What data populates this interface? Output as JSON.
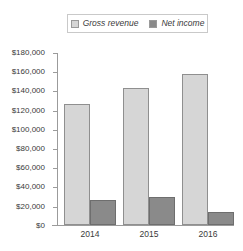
{
  "legend": {
    "position": "top-center",
    "entries": [
      {
        "label": "Gross revenue",
        "color": "#d6d6d6",
        "icon": "legend-swatch-icon"
      },
      {
        "label": "Net income",
        "color": "#8a8a8a",
        "icon": "legend-swatch-icon"
      }
    ]
  },
  "chart_data": {
    "type": "bar",
    "title": "",
    "xlabel": "",
    "ylabel": "",
    "categories": [
      "2014",
      "2015",
      "2016"
    ],
    "series": [
      {
        "name": "Gross revenue",
        "color": "#d6d6d6",
        "values": [
          127000,
          143000,
          158000
        ]
      },
      {
        "name": "Net income",
        "color": "#8a8a8a",
        "values": [
          26000,
          29000,
          14000
        ]
      }
    ],
    "ylim": [
      0,
      180000
    ],
    "ytick_step": 20000,
    "ytick_labels": [
      "$180,000",
      "$160,000",
      "$140,000",
      "$120,000",
      "$100,000",
      "$80,000",
      "$60,000",
      "$40,000",
      "$20,000",
      "$0"
    ],
    "ytick_values": [
      180000,
      160000,
      140000,
      120000,
      100000,
      80000,
      60000,
      40000,
      20000,
      0
    ],
    "grid": false,
    "legend_position": "top-center"
  }
}
